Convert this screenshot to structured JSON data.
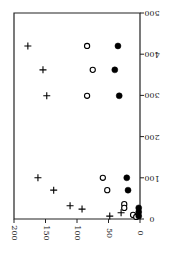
{
  "chart_data": {
    "type": "scatter",
    "title": "",
    "orientation": "rotated-90 (original x-axis drawn vertically on right, original y-axis drawn horizontally at bottom, reversed)",
    "xlabel": "",
    "ylabel": "",
    "xlim": [
      0,
      500
    ],
    "ylim": [
      0,
      200
    ],
    "x_ticks": [
      "0",
      "100",
      "200",
      "300",
      "400",
      "500"
    ],
    "y_ticks": [
      "0",
      "50",
      "100",
      "150",
      "200"
    ],
    "grid": false,
    "legend": null,
    "series": [
      {
        "name": "plus",
        "marker": "+",
        "color": "#000000",
        "points": [
          [
            420,
            178
          ],
          [
            362,
            154
          ],
          [
            299,
            148
          ],
          [
            100,
            162
          ],
          [
            70,
            137
          ],
          [
            32,
            111
          ],
          [
            24,
            92
          ],
          [
            15,
            30
          ],
          [
            7,
            48
          ]
        ]
      },
      {
        "name": "open-circle",
        "marker": "o-open",
        "color": "#000000",
        "points": [
          [
            420,
            84
          ],
          [
            362,
            75
          ],
          [
            299,
            84
          ],
          [
            100,
            59
          ],
          [
            70,
            52
          ],
          [
            36,
            25
          ],
          [
            27,
            25
          ],
          [
            10,
            11
          ],
          [
            5,
            6
          ]
        ]
      },
      {
        "name": "filled-circle",
        "marker": "o-filled",
        "color": "#000000",
        "points": [
          [
            420,
            35
          ],
          [
            362,
            40
          ],
          [
            299,
            33
          ],
          [
            100,
            21
          ],
          [
            70,
            19
          ],
          [
            27,
            2
          ],
          [
            17,
            2
          ],
          [
            7,
            2
          ]
        ]
      }
    ]
  },
  "layout": {
    "frame": {
      "left": 14,
      "top": 13,
      "right": 140,
      "bottom": 219
    }
  }
}
